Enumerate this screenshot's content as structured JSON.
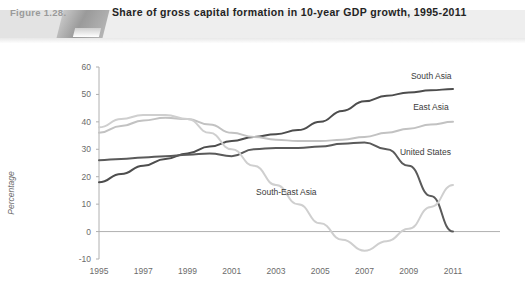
{
  "header": {
    "figure_number": "Figure 1.28.",
    "title": "Share of gross capital formation in 10-year GDP growth, 1995-2011"
  },
  "chart_data": {
    "type": "line",
    "title": "Share of gross capital formation in 10-year GDP growth, 1995-2011",
    "xlabel": "",
    "ylabel": "Percentage",
    "x": [
      1995,
      1996,
      1997,
      1998,
      1999,
      2000,
      2001,
      2002,
      2003,
      2004,
      2005,
      2006,
      2007,
      2008,
      2009,
      2010,
      2011
    ],
    "tick_labels_x": [
      "1995",
      "1997",
      "1999",
      "2001",
      "2003",
      "2005",
      "2007",
      "2009",
      "2011"
    ],
    "tick_labels_y": [
      "60",
      "50",
      "40",
      "30",
      "20",
      "10",
      "0",
      "-10"
    ],
    "ylim": [
      -10,
      60
    ],
    "xlim": [
      1995,
      2011
    ],
    "grid": false,
    "legend_position": "inline-right",
    "series": [
      {
        "name": "South Asia",
        "color": "#4d4d4d",
        "width": 2.0,
        "label_x": 2009.1,
        "label_y": 55.5,
        "values": [
          18,
          21,
          24,
          26.5,
          28.5,
          31,
          33,
          34.5,
          35.5,
          37,
          40,
          44,
          47.5,
          49.5,
          50.7,
          51.5,
          52
        ]
      },
      {
        "name": "East Asia",
        "color": "#c2c2c2",
        "width": 2.0,
        "label_x": 2009.2,
        "label_y": 44.5,
        "values": [
          36,
          38.5,
          40.5,
          41.5,
          41,
          39,
          36,
          34.5,
          33.5,
          33,
          33,
          33.5,
          34.5,
          36,
          37.5,
          39,
          40
        ]
      },
      {
        "name": "United States",
        "color": "#5a5a5a",
        "width": 2.0,
        "label_x": 2008.6,
        "label_y": 28.0,
        "values": [
          26,
          26.5,
          27,
          27.5,
          28,
          28.5,
          27.5,
          30,
          30.5,
          30.5,
          31,
          32,
          32.5,
          30,
          24,
          13,
          0
        ]
      },
      {
        "name": "South-East Asia",
        "color": "#cfcfcf",
        "width": 2.0,
        "label_x": 2002.1,
        "label_y": 13.5,
        "values": [
          38,
          41,
          42.5,
          42.5,
          41,
          36,
          30,
          24,
          17,
          10,
          3,
          -3,
          -7,
          -3.5,
          1,
          9,
          17
        ]
      }
    ]
  }
}
